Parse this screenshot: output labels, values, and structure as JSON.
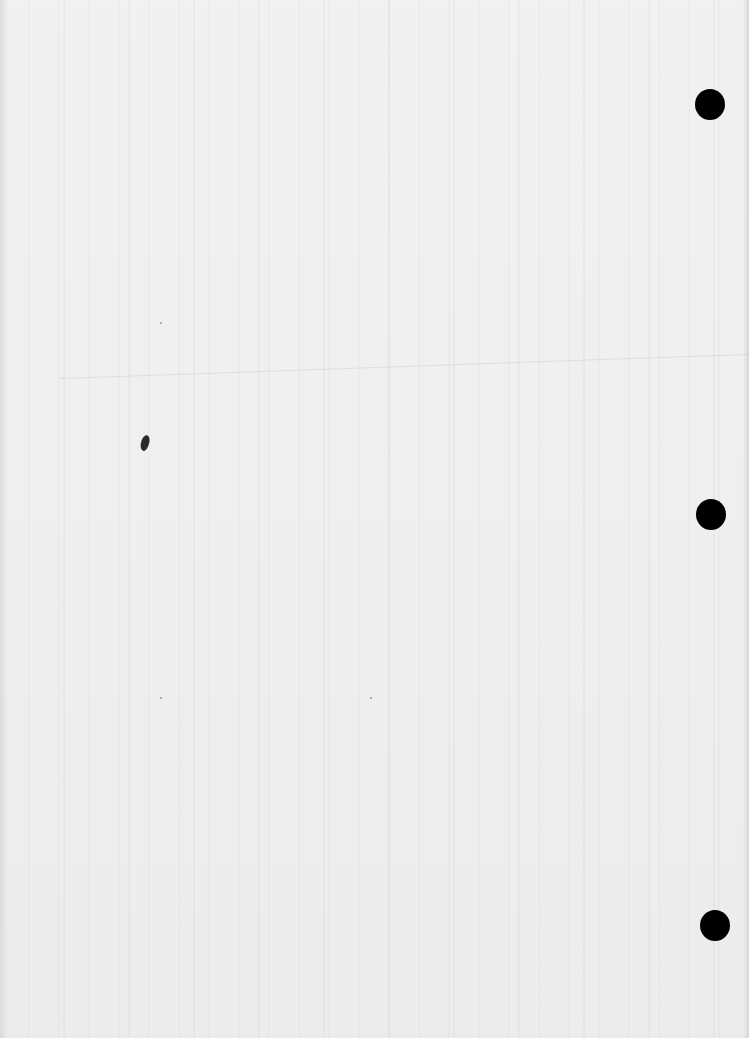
{
  "document": {
    "type": "scanned blank page",
    "text_content": "",
    "background_color": "#eeeeee",
    "punch_holes": [
      {
        "cx": 710,
        "cy": 104,
        "r": 15
      },
      {
        "cx": 711,
        "cy": 514,
        "r": 15
      },
      {
        "cx": 715,
        "cy": 925,
        "r": 15
      }
    ],
    "ink_speck": {
      "x": 145,
      "y": 443
    }
  }
}
